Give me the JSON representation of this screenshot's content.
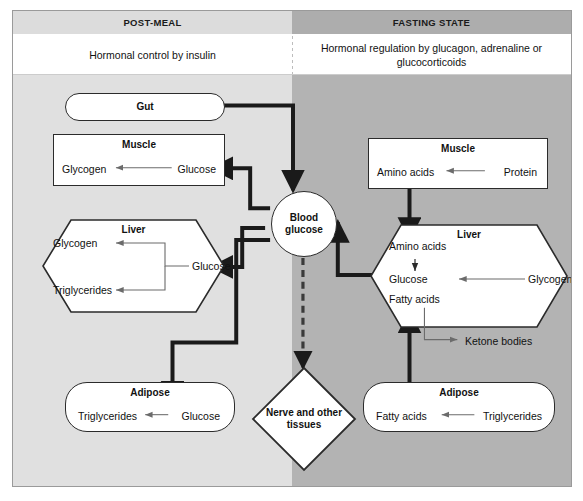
{
  "figure": {
    "panels": {
      "left": {
        "header": "POST-MEAL",
        "subtitle": "Hormonal control by insulin"
      },
      "right": {
        "header": "FASTING STATE",
        "subtitle": "Hormonal regulation by glucagon, adrenaline or glucocorticoids"
      }
    },
    "center": {
      "blood_glucose": "Blood glucose",
      "nerve": "Nerve and other tissues"
    },
    "left_nodes": {
      "gut": {
        "title": "Gut"
      },
      "muscle": {
        "title": "Muscle",
        "from": "Glucose",
        "to": "Glycogen"
      },
      "liver": {
        "title": "Liver",
        "source": "Glucose",
        "product_top": "Glycogen",
        "product_bottom": "Triglycerides"
      },
      "adipose": {
        "title": "Adipose",
        "from": "Glucose",
        "to": "Triglycerides"
      }
    },
    "right_nodes": {
      "muscle": {
        "title": "Muscle",
        "from": "Protein",
        "to": "Amino acids"
      },
      "liver": {
        "title": "Liver",
        "amino_acids": "Amino acids",
        "glucose": "Glucose",
        "glycogen": "Glycogen",
        "fatty_acids": "Fatty acids",
        "ketone_bodies": "Ketone bodies"
      },
      "adipose": {
        "title": "Adipose",
        "from": "Triglycerides",
        "to": "Fatty acids"
      }
    },
    "colors": {
      "panel_left_bg": "#e0e0e0",
      "panel_right_bg": "#b3b3b3",
      "header_left_bg": "#dcdcdc",
      "header_right_bg": "#adadad",
      "subtitle_bg": "#ffffff",
      "shape_fill": "#ffffff",
      "stroke": "#2b2b2b",
      "thin_arrow": "#6b6b6b"
    }
  }
}
